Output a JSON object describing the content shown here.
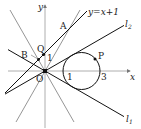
{
  "figure": {
    "origin_px": [
      45,
      71
    ],
    "unit_px": 18,
    "axes": {
      "x_label": "x",
      "y_label": "y",
      "origin_label": "O",
      "color": "#9a9a9a"
    },
    "circle": {
      "center": [
        2,
        0
      ],
      "radius": 1,
      "color": "#111111",
      "intercept_labels": [
        {
          "text": "1",
          "x": 1
        },
        {
          "text": "3",
          "x": 3
        }
      ]
    },
    "lines": [
      {
        "id": "l1",
        "label": "l",
        "subscript": "1",
        "slope": -0.57735,
        "intercept": 0,
        "color": "#111111"
      },
      {
        "id": "l2",
        "label": "l",
        "subscript": "2",
        "slope": 0.57735,
        "intercept": 0,
        "color": "#111111"
      },
      {
        "id": "y_eq_x_plus_1",
        "label": "y=x+1",
        "slope": 1,
        "intercept": 1,
        "color": "#111111"
      },
      {
        "id": "gray_pos",
        "label": "",
        "slope": 1.732,
        "intercept": 0,
        "color": "#7a7a7a"
      },
      {
        "id": "gray_neg",
        "label": "",
        "slope": -1.732,
        "intercept": 0,
        "color": "#7a7a7a"
      }
    ],
    "points": [
      {
        "name": "A",
        "label": "A",
        "dot": false
      },
      {
        "name": "B",
        "label": "B",
        "dot": true
      },
      {
        "name": "Q",
        "label": "Q",
        "dot": true
      },
      {
        "name": "P",
        "label": "P",
        "dot": true
      },
      {
        "name": "O",
        "label": "O",
        "dot": true
      }
    ],
    "y_intercept_label": "1"
  }
}
